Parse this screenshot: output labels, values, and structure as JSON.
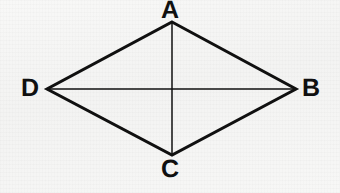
{
  "figure": {
    "kind": "geometry-diagram",
    "shape": "rhombus",
    "background_color": "#f6f6f5",
    "stroke_color": "#101010",
    "outline_stroke_width": 3,
    "diagonal_stroke_width": 1.5,
    "labels": {
      "top": "A",
      "right": "B",
      "bottom": "C",
      "left": "D"
    },
    "vertices": [
      {
        "name": "A",
        "x": 172,
        "y": 22
      },
      {
        "name": "B",
        "x": 296,
        "y": 89
      },
      {
        "name": "C",
        "x": 172,
        "y": 155
      },
      {
        "name": "D",
        "x": 47,
        "y": 89
      }
    ],
    "diagonals": [
      {
        "name": "AC",
        "from": "A",
        "to": "C"
      },
      {
        "name": "BD",
        "from": "B",
        "to": "D"
      }
    ],
    "intersection": {
      "name": "center",
      "x": 172,
      "y": 89
    }
  }
}
